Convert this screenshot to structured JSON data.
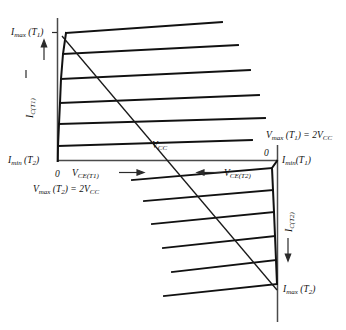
{
  "figure": {
    "type": "transistor-characteristic-curves",
    "labels": {
      "i_max_t1": "Imax (T1)",
      "i_min_t2": "Imin (T2)",
      "i_c_t1": "IC(T1)",
      "v_ce_t1": "VCE(T1)",
      "v_max_t2": "Vmax (T2) = 2VCC",
      "v_cc": "VCC",
      "origin_left": "0",
      "origin_right": "0",
      "v_max_t1": "Vmax (T1) = 2VCC",
      "i_min_t1": "Imin (T1)",
      "v_ce_t2": "VCE(T2)",
      "i_c_t2": "IC(T2)",
      "i_max_t2": "Imax (T2)"
    },
    "colors": {
      "curve": "#111111",
      "axis": "#4a4a4a",
      "loadline": "#1a1a1a",
      "background": "#ffffff"
    }
  },
  "chart_data": {
    "type": "line",
    "title": "",
    "xlabel": "VCE(T1)",
    "ylabel": "IC(T1)",
    "grid": false,
    "legend": null,
    "quadrants": [
      {
        "name": "upper-left",
        "temperature": "T1",
        "x_axis": "VCE(T1)",
        "y_axis": "IC(T1)",
        "x_direction": "right",
        "y_direction": "up",
        "origin_label": "0",
        "y_max_label": "Imax (T1)",
        "y_min_label": "Imin (T2)",
        "x_max_label": "Vmax (T2) = 2VCC",
        "curve_count": 6
      },
      {
        "name": "lower-right",
        "temperature": "T2",
        "x_axis": "VCE(T2)",
        "y_axis": "IC(T2)",
        "x_direction": "left",
        "y_direction": "down",
        "origin_label": "0",
        "y_max_label": "Imax (T2)",
        "y_min_label": "Imin (T1)",
        "x_max_label": "Vmax (T1) = 2VCC",
        "curve_count": 6
      }
    ],
    "loadline": {
      "label": "VCC",
      "from": [
        62,
        36
      ],
      "to": [
        277,
        290
      ],
      "crosses_x_axis_at_label": "VCC"
    },
    "upper_curves": [
      {
        "x1": 66,
        "y1": 33,
        "x2": 222,
        "y2": 22
      },
      {
        "x1": 63,
        "y1": 54,
        "x2": 238,
        "y2": 45
      },
      {
        "x1": 61,
        "y1": 79,
        "x2": 250,
        "y2": 70
      },
      {
        "x1": 60,
        "y1": 103,
        "x2": 259,
        "y2": 95
      },
      {
        "x1": 59,
        "y1": 124,
        "x2": 265,
        "y2": 118
      },
      {
        "x1": 58,
        "y1": 146,
        "x2": 252,
        "y2": 140
      }
    ],
    "lower_curves": [
      {
        "x1": 272,
        "y1": 168,
        "x2": 132,
        "y2": 180
      },
      {
        "x1": 273,
        "y1": 190,
        "x2": 144,
        "y2": 201
      },
      {
        "x1": 274,
        "y1": 212,
        "x2": 152,
        "y2": 224
      },
      {
        "x1": 275,
        "y1": 236,
        "x2": 163,
        "y2": 248
      },
      {
        "x1": 276,
        "y1": 260,
        "x2": 172,
        "y2": 272
      },
      {
        "x1": 277,
        "y1": 284,
        "x2": 164,
        "y2": 296
      }
    ]
  }
}
